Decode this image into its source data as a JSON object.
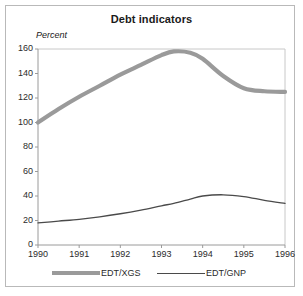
{
  "chart_data": {
    "type": "line",
    "title": "Debt indicators",
    "ylabel": "Percent",
    "xlabel": "",
    "grid": false,
    "legend_position": "bottom",
    "xlim": [
      1990,
      1996
    ],
    "ylim": [
      0,
      160
    ],
    "yticks": [
      0,
      20,
      40,
      60,
      80,
      100,
      120,
      140,
      160
    ],
    "xticks": [
      1990,
      1991,
      1992,
      1993,
      1994,
      1995,
      1996
    ],
    "xtick_labels": [
      "1990",
      "1991",
      "1992",
      "1993",
      "1994",
      "1995",
      "1996"
    ],
    "ytick_labels": [
      "0",
      "20",
      "40",
      "60",
      "80",
      "100",
      "120",
      "140",
      "160"
    ],
    "x": [
      1990,
      1990.5,
      1991,
      1991.5,
      1992,
      1992.5,
      1993,
      1993.3,
      1993.7,
      1994,
      1994.5,
      1995,
      1995.5,
      1996
    ],
    "series": [
      {
        "name": "EDT/XGS",
        "color": "#9a9a9a",
        "style": "thick",
        "values": [
          100,
          111,
          121,
          130,
          139,
          147,
          155,
          158,
          157,
          152,
          138,
          128,
          125.5,
          125
        ]
      },
      {
        "name": "EDT/GNP",
        "color": "#4a4a4a",
        "style": "thin",
        "values": [
          18,
          19.5,
          21,
          23,
          25.5,
          28.5,
          32,
          34,
          37.5,
          40,
          41,
          39.5,
          36.5,
          34
        ]
      }
    ]
  },
  "legend": {
    "items": [
      {
        "label": "EDT/XGS"
      },
      {
        "label": "EDT/GNP"
      }
    ]
  }
}
